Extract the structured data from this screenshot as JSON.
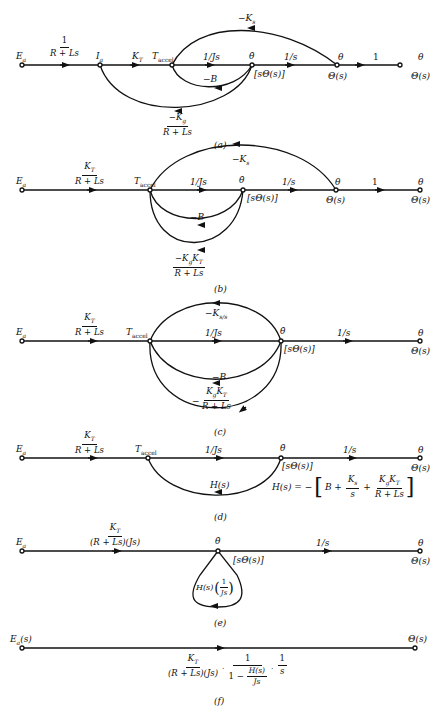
{
  "diagrams": {
    "a": {
      "caption": "(a)",
      "nodes": [
        "Ea",
        "Ia",
        "Taccel",
        "θ̇",
        "θ",
        "θ"
      ],
      "node_labels": {
        "Ea": "E",
        "Ea_sub": "a",
        "Ia": "I",
        "Ia_sub": "a",
        "Taccel": "T",
        "Taccel_sub": "accel",
        "theta_dot": "θ̇",
        "s_theta": "[sΘ(s)]",
        "theta": "θ",
        "Theta_s": "Θ(s)",
        "theta_out": "θ",
        "Theta_s_out": "Θ(s)"
      },
      "gains": {
        "g1_num": "1",
        "g1_den": "R + Ls",
        "KT": "K",
        "KT_sub": "T",
        "inv_Js": "1/Js",
        "inv_s": "1/s",
        "one": "1",
        "minus_Ks": "−K",
        "minus_Ks_sub": "s",
        "minus_B": "−B",
        "minus_Kg_num": "−K",
        "minus_Kg_num_sub": "g",
        "minus_Kg_den": "R + Ls"
      }
    },
    "b": {
      "caption": "(b)",
      "node_labels": {
        "Ea": "E",
        "Ea_sub": "a",
        "Taccel": "T",
        "Taccel_sub": "accel",
        "theta_dot": "θ̇",
        "s_theta": "[sΘ(s)]",
        "theta": "θ",
        "Theta_s": "Θ(s)",
        "theta_out": "θ",
        "Theta_s_out": "Θ(s)"
      },
      "gains": {
        "KT_num": "K",
        "KT_num_sub": "T",
        "KT_den": "R + Ls",
        "inv_Js": "1/Js",
        "inv_s": "1/s",
        "one": "1",
        "minus_Ks": "−K",
        "minus_Ks_sub": "s",
        "minus_B": "−B",
        "KgKT_num": "−K",
        "KgKT_num_sub1": "g",
        "KgKT_num_mid": "K",
        "KgKT_num_sub2": "T",
        "KgKT_den": "R + Ls"
      }
    },
    "c": {
      "caption": "(c)",
      "node_labels": {
        "Ea": "E",
        "Ea_sub": "a",
        "Taccel": "T",
        "Taccel_sub": "accel",
        "theta_dot": "θ̇",
        "s_theta": "[sΘ(s)]",
        "theta_out": "θ",
        "Theta_s_out": "Θ(s)"
      },
      "gains": {
        "KT_num": "K",
        "KT_num_sub": "T",
        "KT_den": "R + Ls",
        "inv_Js": "1/Js",
        "inv_s": "1/s",
        "minus_Ks_over_s": "−K",
        "minus_Ks_over_s_sub": "s/s",
        "minus_B": "−B",
        "minus_sign": "−",
        "KgKT_num": "K",
        "KgKT_num_sub1": "g",
        "KgKT_num_sub2": "T",
        "KgKT_den": "R + Ls"
      }
    },
    "d": {
      "caption": "(d)",
      "node_labels": {
        "Ea": "E",
        "Ea_sub": "a",
        "Taccel": "T",
        "Taccel_sub": "accel",
        "theta_dot": "θ̇",
        "s_theta": "[sΘ(s)]",
        "theta_out": "θ",
        "Theta_s_out": "Θ(s)"
      },
      "gains": {
        "KT_num": "K",
        "KT_num_sub": "T",
        "KT_den": "R + Ls",
        "inv_Js": "1/Js",
        "inv_s": "1/s",
        "Hs": "H(s)"
      },
      "equation": {
        "lhs": "H(s) = −",
        "B": "B +",
        "Ks_num": "K",
        "Ks_num_sub": "s",
        "Ks_den": "s",
        "plus": "+",
        "KgKT_num": "K",
        "KgKT_sub1": "g",
        "KgKT_sub2": "T",
        "KgKT_den": "R + Ls"
      }
    },
    "e": {
      "caption": "(e)",
      "node_labels": {
        "Ea": "E",
        "Ea_sub": "a",
        "theta_dot": "θ̇",
        "s_theta": "[sΘ(s)]",
        "theta_out": "θ",
        "Theta_s_out": "Θ(s)"
      },
      "gains": {
        "fwd_num": "K",
        "fwd_num_sub": "T",
        "fwd_den": "(R + Ls)(Js)",
        "inv_s": "1/s",
        "loop_pre": "H(s)",
        "loop_num": "1",
        "loop_den": "Js"
      }
    },
    "f": {
      "caption": "(f)",
      "node_labels": {
        "Eas": "E",
        "Eas_sub": "a",
        "Eas_suffix": "(s)",
        "Theta_s": "Θ(s)"
      },
      "gain": {
        "t1_num": "K",
        "t1_num_sub": "T",
        "t1_den": "(R + Ls)(Js)",
        "dot": "·",
        "t2_num": "1",
        "t2_den_pre": "1 −",
        "t2_den_num": "H(s)",
        "t2_den_den": "Js",
        "t3_num": "1",
        "t3_den": "s"
      }
    }
  }
}
